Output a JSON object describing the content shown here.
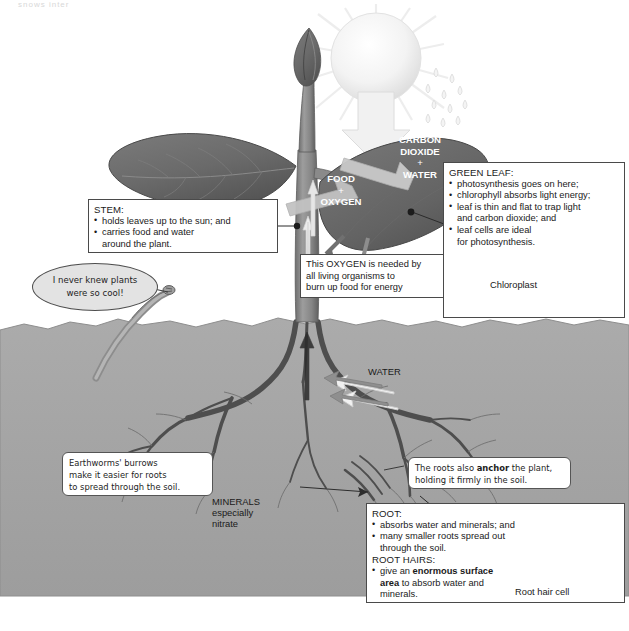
{
  "page": {
    "cropped_header_text": "snows inter"
  },
  "colors": {
    "soil": "#a8a8a8",
    "soil_dark": "#9a9a9a",
    "leaf": "#6e6e6e",
    "leaf_dark": "#585858",
    "stem": "#8c8c8c",
    "root": "#555555",
    "sun": "#f2f2f2",
    "box_border": "#4a4a4a",
    "bubble_fill": "#e3e3e3",
    "arrow_light": "#e8e8e8",
    "arrow_mid": "#bdbdbd"
  },
  "artwork": {
    "sun": "sun-icon",
    "rain": "raindrops-icon",
    "leaf_top": "leaf-shape",
    "leaf_right": "leaf-shape",
    "bud": "flower-bud-shape",
    "stem": "stem-shape",
    "roots": "root-system-shape",
    "earthworm": "earthworm-shape"
  },
  "leaf_labels": {
    "input": {
      "line1": "CARBON",
      "line2": "DIOXIDE",
      "plus": "+",
      "line3": "WATER"
    },
    "output": {
      "line1": "FOOD",
      "plus": "+",
      "line2": "OXYGEN"
    }
  },
  "soil_labels": {
    "water": "WATER",
    "minerals": {
      "line1": "MINERALS",
      "line2": "especially",
      "line3": "nitrate"
    }
  },
  "boxes": {
    "stem": {
      "heading": "STEM:",
      "bullets": [
        "holds leaves up to the sun; and",
        "carries food and water"
      ],
      "continuation": "around the plant."
    },
    "oxygen": {
      "lines": [
        "This OXYGEN is needed by",
        "all living organisms to",
        "burn up food for energy"
      ]
    },
    "green_leaf": {
      "heading": "GREEN LEAF:",
      "bullets": [
        "photosynthesis goes on here;",
        "chlorophyll absorbs light energy;",
        "leaf is thin and flat to trap light",
        "leaf cells are ideal"
      ],
      "cont_3": "and carbon dioxide; and",
      "cont_4": "for photosynthesis.",
      "chloroplast_label": "Chloroplast",
      "cell_icon": "plant-cell-icon"
    },
    "root": {
      "heading": "ROOT:",
      "bullets": [
        "absorbs water and minerals; and",
        "many smaller roots spread out"
      ],
      "cont_2": "through the soil.",
      "heading2": "ROOT HAIRS:",
      "bullet3_pre": "give an ",
      "bullet3_bold": "enormous surface",
      "bullet3_line2_bold": "area",
      "bullet3_line2_rest": " to absorb water and",
      "bullet3_line3": "minerals.",
      "cell_label": "Root hair cell",
      "cell_icon": "root-hair-cell-icon"
    },
    "anchor": {
      "line1_pre": "The roots also ",
      "line1_bold": "anchor",
      "line1_post": " the plant,",
      "line2": "holding it firmly in the soil."
    },
    "earthworm_note": {
      "line1": "Earthworms' burrows",
      "line2": "make it easier for roots",
      "line3": "to spread through the soil."
    },
    "worm_bubble": {
      "line1": "I never knew plants",
      "line2": "were so cool!"
    }
  }
}
